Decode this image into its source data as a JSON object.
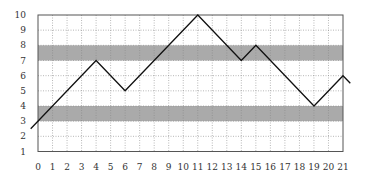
{
  "chart_data": {
    "type": "line",
    "title": "",
    "xlabel": "",
    "ylabel": "",
    "xlim": [
      0,
      21
    ],
    "ylim": [
      1,
      10
    ],
    "grid": true,
    "legend": null,
    "x_ticks": [
      0,
      1,
      2,
      3,
      4,
      5,
      6,
      7,
      8,
      9,
      10,
      11,
      12,
      13,
      14,
      15,
      16,
      17,
      18,
      19,
      20,
      21
    ],
    "y_ticks": [
      1,
      2,
      3,
      4,
      5,
      6,
      7,
      8,
      9,
      10
    ],
    "series": [
      {
        "name": "path",
        "color": "#111111",
        "x": [
          -0.5,
          4,
          6,
          11,
          14,
          15,
          19,
          21,
          21.5
        ],
        "y": [
          2.5,
          7,
          5,
          10,
          7,
          8,
          4,
          6,
          5.5
        ]
      }
    ],
    "bands": [
      {
        "y_from": 3,
        "y_to": 4,
        "color": "#aaaaaa"
      },
      {
        "y_from": 7,
        "y_to": 8,
        "color": "#aaaaaa"
      }
    ]
  },
  "colors": {
    "frame": "#555555",
    "grid": "#888888",
    "band": "#aaaaaa",
    "line": "#111111"
  }
}
